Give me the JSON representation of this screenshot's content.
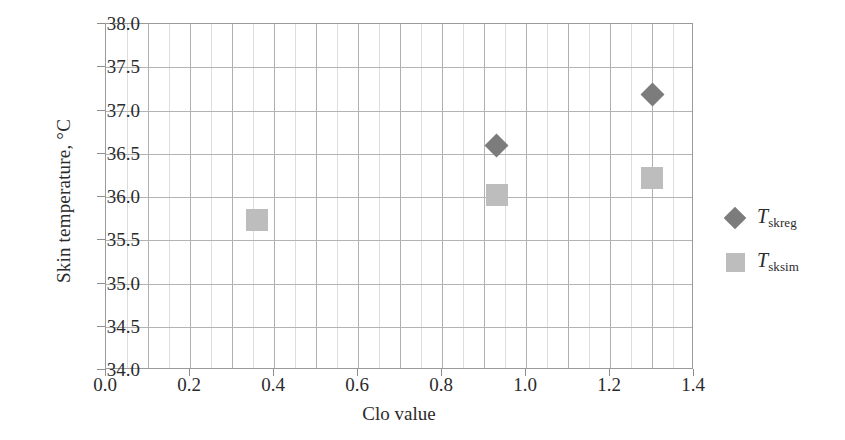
{
  "chart_data": {
    "type": "scatter",
    "title": "",
    "xlabel": "Clo value",
    "ylabel": "Skin temperature, °C",
    "xlim": [
      0.0,
      1.4
    ],
    "ylim": [
      34.0,
      38.0
    ],
    "xticks": [
      "0.0",
      "0.2",
      "0.4",
      "0.6",
      "0.8",
      "1.0",
      "1.2",
      "1.4"
    ],
    "xtick_values": [
      0.0,
      0.2,
      0.4,
      0.6,
      0.8,
      1.0,
      1.2,
      1.4
    ],
    "yticks": [
      "34.0",
      "34.5",
      "35.0",
      "35.5",
      "36.0",
      "36.5",
      "37.0",
      "37.5",
      "38.0"
    ],
    "ytick_values": [
      34.0,
      34.5,
      35.0,
      35.5,
      36.0,
      36.5,
      37.0,
      37.5,
      38.0
    ],
    "grid": "both-axes-minor-vertical-every-0.05-major-every-0.1-horizontal-every-0.5",
    "legend_position": "right-outside",
    "series": [
      {
        "name": "T_skreg",
        "label_var": "T",
        "label_sub": "skreg",
        "marker": "diamond",
        "color": "#7c7c7c",
        "points": [
          {
            "x": 0.93,
            "y": 36.6
          },
          {
            "x": 1.3,
            "y": 37.18
          }
        ]
      },
      {
        "name": "T_sksim",
        "label_var": "T",
        "label_sub": "sksim",
        "marker": "square",
        "color": "#bdbdbd",
        "points": [
          {
            "x": 0.36,
            "y": 35.73
          },
          {
            "x": 0.93,
            "y": 36.02
          },
          {
            "x": 1.3,
            "y": 36.22
          }
        ]
      }
    ]
  },
  "axes": {
    "frame_color": "#9a9a9a",
    "gridline_major_color": "#b0b0b0",
    "gridline_minor_color": "#dcdcdc"
  }
}
